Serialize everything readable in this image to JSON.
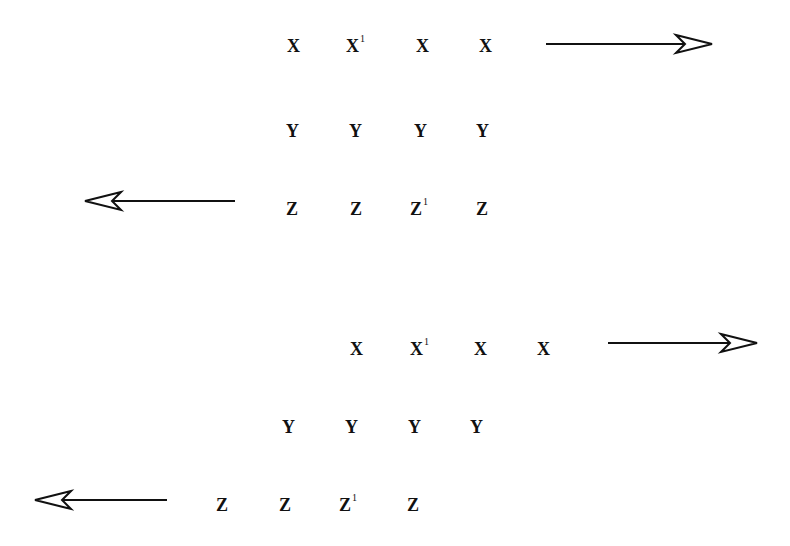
{
  "diagrams": [
    {
      "name": "aligned-layers",
      "rows": [
        {
          "labels": [
            {
              "base": "X",
              "sup": ""
            },
            {
              "base": "X",
              "sup": "1"
            },
            {
              "base": "X",
              "sup": ""
            },
            {
              "base": "X",
              "sup": ""
            }
          ],
          "y": 37,
          "xs": [
            287,
            346,
            416,
            479
          ]
        },
        {
          "labels": [
            {
              "base": "Y",
              "sup": ""
            },
            {
              "base": "Y",
              "sup": ""
            },
            {
              "base": "Y",
              "sup": ""
            },
            {
              "base": "Y",
              "sup": ""
            }
          ],
          "y": 122,
          "xs": [
            286,
            349,
            414,
            476
          ]
        },
        {
          "labels": [
            {
              "base": "Z",
              "sup": ""
            },
            {
              "base": "Z",
              "sup": ""
            },
            {
              "base": "Z",
              "sup": "1"
            },
            {
              "base": "Z",
              "sup": ""
            }
          ],
          "y": 200,
          "xs": [
            286,
            350,
            410,
            476
          ]
        }
      ],
      "arrows": [
        {
          "direction": "right",
          "x1": 546,
          "x2": 712,
          "y": 44
        },
        {
          "direction": "left",
          "x1": 85,
          "x2": 235,
          "y": 201
        }
      ]
    },
    {
      "name": "shifted-layers",
      "rows": [
        {
          "labels": [
            {
              "base": "X",
              "sup": ""
            },
            {
              "base": "X",
              "sup": "1"
            },
            {
              "base": "X",
              "sup": ""
            },
            {
              "base": "X",
              "sup": ""
            }
          ],
          "y": 340,
          "xs": [
            350,
            410,
            474,
            537
          ]
        },
        {
          "labels": [
            {
              "base": "Y",
              "sup": ""
            },
            {
              "base": "Y",
              "sup": ""
            },
            {
              "base": "Y",
              "sup": ""
            },
            {
              "base": "Y",
              "sup": ""
            }
          ],
          "y": 418,
          "xs": [
            282,
            345,
            408,
            470
          ]
        },
        {
          "labels": [
            {
              "base": "Z",
              "sup": ""
            },
            {
              "base": "Z",
              "sup": ""
            },
            {
              "base": "Z",
              "sup": "1"
            },
            {
              "base": "Z",
              "sup": ""
            }
          ],
          "y": 496,
          "xs": [
            216,
            279,
            339,
            407
          ]
        }
      ],
      "arrows": [
        {
          "direction": "right",
          "x1": 608,
          "x2": 757,
          "y": 343
        },
        {
          "direction": "left",
          "x1": 35,
          "x2": 167,
          "y": 500
        }
      ]
    }
  ]
}
